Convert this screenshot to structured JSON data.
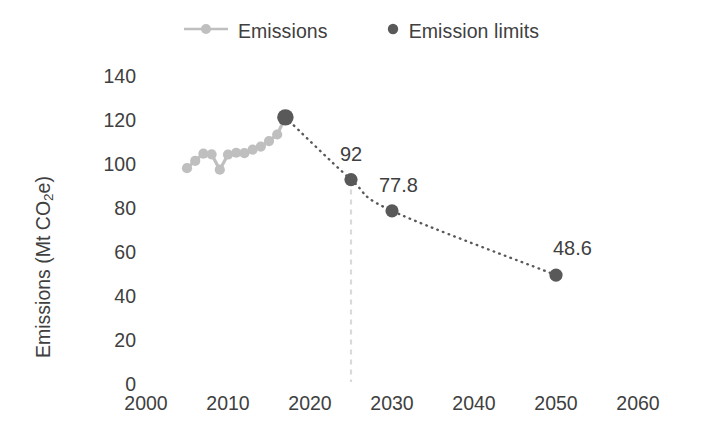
{
  "chart_data": {
    "type": "line",
    "title": "",
    "xlabel": "",
    "ylabel": "Emissions (Mt CO2e)",
    "ylabel_parts": {
      "pre": "Emissions (Mt CO",
      "sub": "2",
      "post": "e)"
    },
    "xlim": [
      2000,
      2062
    ],
    "ylim": [
      0,
      140
    ],
    "xticks": [
      2000,
      2010,
      2020,
      2030,
      2040,
      2050,
      2060
    ],
    "yticks": [
      0,
      20,
      40,
      60,
      80,
      100,
      120,
      140
    ],
    "xtick_labels": [
      "2000",
      "2010",
      "2020",
      "2030",
      "2040",
      "2050",
      "2060"
    ],
    "ytick_labels": [
      "0",
      "20",
      "40",
      "60",
      "80",
      "100",
      "120",
      "140"
    ],
    "grid": false,
    "axis_lines": false,
    "legend_position": "top-center",
    "series": [
      {
        "name": "Emissions",
        "style": "line-with-markers",
        "color": "#BFBFBF",
        "x": [
          2005,
          2006,
          2007,
          2008,
          2009,
          2010,
          2011,
          2012,
          2013,
          2014,
          2015,
          2016,
          2017
        ],
        "values": [
          97.2,
          100.5,
          103.8,
          103.5,
          96.5,
          103.4,
          104.2,
          104.0,
          105.6,
          107.0,
          109.5,
          112.5,
          120.3
        ]
      },
      {
        "name": "Emission limits",
        "style": "dotted-with-markers",
        "color": "#595959",
        "x": [
          2017,
          2025,
          2030,
          2050
        ],
        "values": [
          120.3,
          92,
          77.8,
          48.6
        ],
        "point_labels": [
          "",
          "92",
          "77.8",
          "48.6"
        ]
      }
    ],
    "annotations": [
      {
        "name": "target-year-guide",
        "type": "vertical-dashed-line",
        "x": 2025,
        "from_y": 92,
        "to_y": 0,
        "color": "#D9D9D9"
      }
    ]
  },
  "legend": {
    "items": [
      {
        "label": "Emissions",
        "marker": "line-marker-icon",
        "color": "#BFBFBF"
      },
      {
        "label": "Emission limits",
        "marker": "dot-marker-icon",
        "color": "#595959"
      }
    ]
  }
}
